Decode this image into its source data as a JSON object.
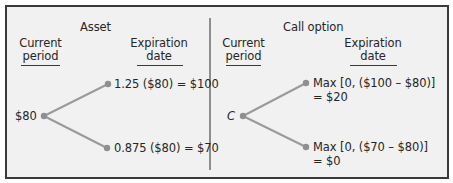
{
  "colors": {
    "background": "#f1f1f1",
    "border": "#3a3a3a",
    "branch": "#9a9a9a",
    "text": "#262626"
  },
  "asset_panel": {
    "title": "Asset",
    "current_header_line1": "Current",
    "current_header_line2": "period",
    "expiration_header_line1": "Expiration",
    "expiration_header_line2": "date",
    "root_label": "$80",
    "up_label": "1.25 ($80) = $100",
    "down_label": "0.875 ($80) = $70"
  },
  "option_panel": {
    "title": "Call option",
    "current_header_line1": "Current",
    "current_header_line2": "period",
    "expiration_header_line1": "Expiration",
    "expiration_header_line2": "date",
    "root_label": "C",
    "up_label_line1": "Max [0, ($100 – $80)]",
    "up_label_line2": "= $20",
    "down_label_line1": "Max [0, ($70 – $80)]",
    "down_label_line2": "= $0"
  }
}
